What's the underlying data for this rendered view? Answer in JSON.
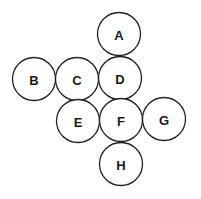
{
  "diagram": {
    "type": "circle-arrangement",
    "colors": {
      "stroke": "#222222",
      "fill": "#ffffff",
      "text": "#1a1a1a"
    },
    "radius": 21.5,
    "nodes": [
      {
        "id": "A",
        "label": "A",
        "cx": 119,
        "cy": 34
      },
      {
        "id": "B",
        "label": "B",
        "cx": 34,
        "cy": 79
      },
      {
        "id": "C",
        "label": "C",
        "cx": 77,
        "cy": 79
      },
      {
        "id": "D",
        "label": "D",
        "cx": 120,
        "cy": 78
      },
      {
        "id": "E",
        "label": "E",
        "cx": 78,
        "cy": 121
      },
      {
        "id": "F",
        "label": "F",
        "cx": 121,
        "cy": 120
      },
      {
        "id": "G",
        "label": "G",
        "cx": 164,
        "cy": 119
      },
      {
        "id": "H",
        "label": "H",
        "cx": 121,
        "cy": 164
      }
    ]
  }
}
